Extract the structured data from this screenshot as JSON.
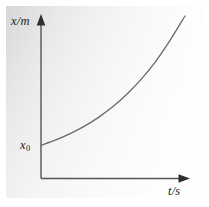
{
  "figure": {
    "name": "position-time-exponential-graph",
    "background_outer": "#ffffff",
    "panel_gradient_from": "#d2d2d2",
    "panel_gradient_to": "#ffffff"
  },
  "labels": {
    "y_axis": "x/m",
    "x_axis": "t/s",
    "intercept_symbol": "x",
    "intercept_subscript": "0"
  },
  "colors": {
    "axis": "#555555",
    "curve": "#6e6a66",
    "text": "#1b1b1b"
  },
  "chart_data": {
    "type": "line",
    "title": "",
    "subtitle": "",
    "xlabel": "t/s",
    "ylabel": "x/m",
    "grid": false,
    "legend": null,
    "xlim": [
      0,
      1
    ],
    "ylim": [
      0,
      1
    ],
    "xticks": [],
    "yticks": [
      "x₀"
    ],
    "annotations": [
      {
        "text": "x₀",
        "meaning": "initial position intercept on vertical axis",
        "x": 0,
        "y": 0.205
      }
    ],
    "series": [
      {
        "name": "position vs time (exponential growth)",
        "x": [
          0.0,
          0.1,
          0.2,
          0.3,
          0.4,
          0.5,
          0.6,
          0.7,
          0.8,
          0.9,
          1.0
        ],
        "y": [
          0.205,
          0.237,
          0.276,
          0.322,
          0.378,
          0.444,
          0.523,
          0.616,
          0.726,
          0.856,
          1.0
        ]
      }
    ]
  }
}
